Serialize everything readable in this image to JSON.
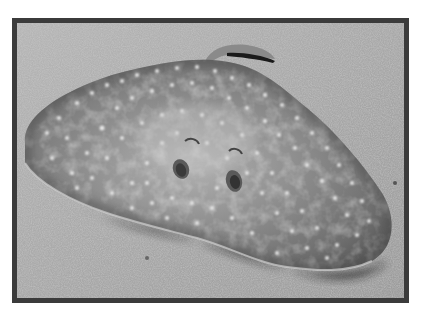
{
  "image": {
    "subject": "Spotted ray lying on sandy seafloor",
    "alt": "Grayscale photograph of a ray with light spots resting on sand",
    "style": "grayscale photograph in dark border frame",
    "colors": {
      "border": "#3b3b3b",
      "sand": "#a9a9a9",
      "body": "#7c7c7c",
      "spots": "#e6e6e6",
      "shadow": "#1c1c1c"
    }
  }
}
